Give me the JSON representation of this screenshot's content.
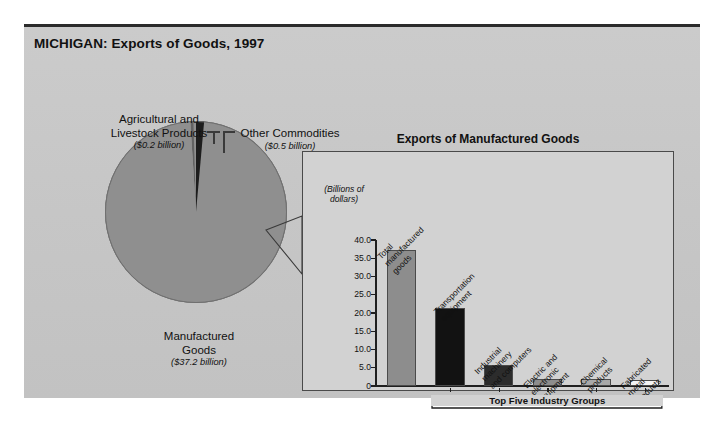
{
  "page_title": "MICHIGAN: Exports of Goods, 1997",
  "pie": {
    "labels": [
      {
        "name": "Agricultural and\nLivestock Products",
        "name_line1": "Agricultural and",
        "name_line2": "Livestock Products",
        "amount": "($0.2 billion)"
      },
      {
        "name": "Other Commodities",
        "name_line1": "Other Commodities",
        "name_line2": "",
        "amount": "($0.5 billion)"
      },
      {
        "name": "Manufactured\nGoods",
        "name_line1": "Manufactured",
        "name_line2": "Goods",
        "amount": "($37.2 billion)"
      }
    ]
  },
  "bar_panel": {
    "title": "Exports of Manufactured Goods",
    "axis_caption_line1": "(Billions of",
    "axis_caption_line2": "dollars)",
    "bracket_label": "Top Five Industry Groups"
  },
  "chart_data": [
    {
      "type": "pie",
      "title": "MICHIGAN: Exports of Goods, 1997",
      "unit": "billions of dollars",
      "categories": [
        "Manufactured Goods",
        "Other Commodities",
        "Agricultural and Livestock Products"
      ],
      "values": [
        37.2,
        0.5,
        0.2
      ],
      "value_labels": [
        "($37.2 billion)",
        "($0.5 billion)",
        "($0.2 billion)"
      ],
      "colors": [
        "#8f8f8f",
        "#1d1d1d",
        "#636363"
      ],
      "legend": "none",
      "total": 37.9
    },
    {
      "type": "bar",
      "title": "Exports of Manufactured Goods",
      "xlabel": "",
      "ylabel": "(Billions of dollars)",
      "ylim": [
        0,
        40
      ],
      "ytick_labels": [
        "40.0",
        "35.0",
        "30.0",
        "25.0",
        "20.0",
        "15.0",
        "10.0",
        "5.0",
        "0"
      ],
      "ytick_values": [
        40.0,
        35.0,
        30.0,
        25.0,
        20.0,
        15.0,
        10.0,
        5.0,
        0
      ],
      "grid": false,
      "categories": [
        "Total manufactured goods",
        "Transportation equipment",
        "Industrial machinery and computers",
        "Electric and electronic equipment",
        "Chemical products",
        "Fabricated metal products"
      ],
      "category_lines": [
        [
          "Total",
          "manufactured",
          "goods"
        ],
        [
          "Transportation",
          "equipment"
        ],
        [
          "Industrial",
          "machinery",
          "and computers"
        ],
        [
          "Electric and",
          "electronic",
          "equipment"
        ],
        [
          "Chemical",
          "products"
        ],
        [
          "Fabricated",
          "metal",
          "products"
        ]
      ],
      "values": [
        37.2,
        21.4,
        5.7,
        2.0,
        2.0,
        1.7
      ],
      "bar_colors": [
        "#8d8d8d",
        "#121212",
        "#2c2c2c",
        "#8d8d8d",
        "#a8a8a8",
        "#f4f4f4"
      ],
      "annotation": "Top Five Industry Groups",
      "annotation_span": [
        1,
        5
      ]
    }
  ]
}
